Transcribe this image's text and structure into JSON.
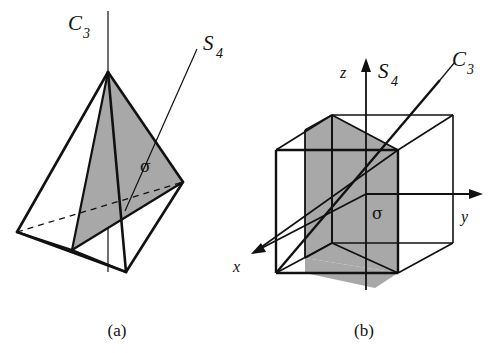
{
  "figure": {
    "panels": [
      {
        "id": "a",
        "caption": "(a)",
        "object": "tetrahedron",
        "labels": {
          "c3_base": "C",
          "c3_sub": "3",
          "s4_base": "S",
          "s4_sub": "4",
          "sigma": "σ"
        }
      },
      {
        "id": "b",
        "caption": "(b)",
        "object": "cube",
        "labels": {
          "z_axis": "z",
          "y_axis": "y",
          "x_axis": "x",
          "s4_base": "S",
          "s4_sub": "4",
          "c3_base": "C",
          "c3_sub": "3",
          "sigma": "σ"
        }
      }
    ],
    "colors": {
      "background": "#ffffff",
      "stroke": "#111111",
      "shaded_plane_fill": "#a8a8a8",
      "thin_stroke": "#111111"
    }
  }
}
